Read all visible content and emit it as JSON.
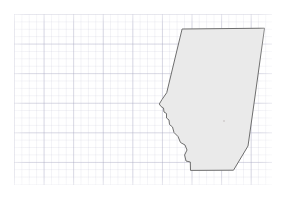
{
  "view": {
    "title": "Alberta",
    "width": 285,
    "height": 198,
    "background_color": "#ffffff"
  },
  "grid": {
    "name": "graticule-grid",
    "visible": true,
    "minor_spacing_px": 7.4,
    "major_spacing_px": 29.6,
    "minor_color": "#b0b0c8",
    "major_color": "#9696b4",
    "origin_x_px": 14,
    "origin_y_px": 14,
    "width_px": 258,
    "height_px": 171
  },
  "region": {
    "name": "alberta-outline",
    "label": "Alberta",
    "fill_color": "#eaeaea",
    "stroke_color": "#6e6e6e",
    "stroke_width": 1,
    "bounds": {
      "x_min": 159,
      "y_min": 28,
      "x_max": 265,
      "y_max": 171
    },
    "outline_path": "M 182.5,29.0 L 264.5,28.2 L 254.5,100.0 L 248.0,146.0 L 233.5,170.2 L 190.5,170.4 L 190.3,162.0 L 186.0,161.0 L 184.6,155.0 L 187.0,150.0 L 185.0,145.0 L 180.5,142.5 L 178.0,136.5 L 174.0,132.5 L 172.5,127.0 L 169.5,124.5 L 169.0,120.0 L 166.5,118.0 L 166.5,113.5 L 164.0,112.0 L 163.5,108.0 L 161.0,106.5 L 159.3,104.0 L 162.0,99.5 L 166.5,93.0 Z",
    "marker_points": [
      {
        "name": "interior-point",
        "x": 224,
        "y": 121,
        "r": 0.8
      }
    ]
  }
}
